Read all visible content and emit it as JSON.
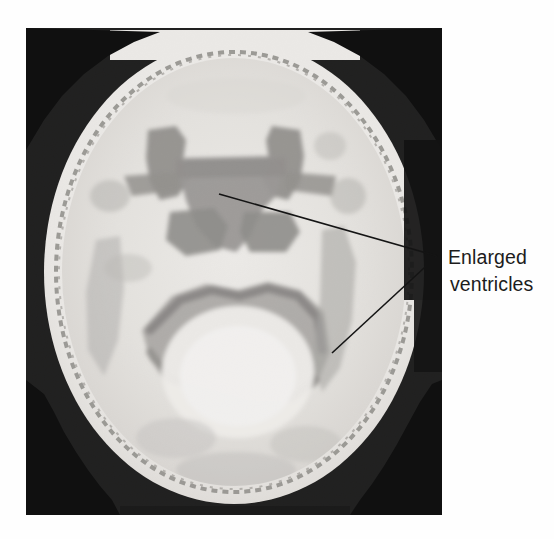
{
  "figure": {
    "kind": "axial-brain-scan-annotated",
    "background_color": "#fefefe"
  },
  "scan": {
    "name": "axial-head-scan",
    "modality_appearance": "grayscale-axial-brain-slice",
    "frame": {
      "x": 26,
      "y": 28,
      "width": 416,
      "height": 487
    },
    "background_color": "#0d0d0d",
    "skull_outer_color": "#ebe9e6",
    "skull_rim_color": "#8f8d8a",
    "brain_parenchyma_color": "#e4e2de",
    "ventricle_color": "#9b9996",
    "ventricle_dark_color": "#7d7b79"
  },
  "annotation": {
    "label_line_1": "Enlarged",
    "label_line_2": "ventricles",
    "text_color": "#1c1c1c",
    "leader_color": "#141414",
    "vertex": {
      "x": 437,
      "y": 256
    },
    "pointer_upper_target": {
      "x": 219,
      "y": 194
    },
    "pointer_lower_target": {
      "x": 332,
      "y": 353
    },
    "text_origin": {
      "x": 448,
      "y": 264
    },
    "line_gap": 27
  }
}
